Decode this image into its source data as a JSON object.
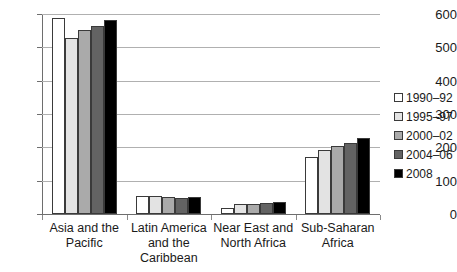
{
  "chart_data": {
    "type": "bar",
    "title": "",
    "subtitle": "",
    "xlabel": "",
    "ylabel": "",
    "ylim": [
      0,
      600
    ],
    "ytick_step": 100,
    "yticks": [
      600,
      500,
      400,
      300,
      200,
      100,
      0
    ],
    "grid": true,
    "legend_position": "right",
    "categories": [
      "Asia and the Pacific",
      "Latin America and the Caribbean",
      "Near East and North Africa",
      "Sub-Saharan Africa"
    ],
    "series": [
      {
        "name": "1990–92",
        "color": "#ffffff",
        "values": [
          587,
          54,
          19,
          170
        ]
      },
      {
        "name": "1995–97",
        "color": "#e3e3e3",
        "values": [
          529,
          53,
          29,
          193
        ]
      },
      {
        "name": "2000–02",
        "color": "#aaaaaa",
        "values": [
          551,
          50,
          31,
          204
        ]
      },
      {
        "name": "2004–06",
        "color": "#636363",
        "values": [
          565,
          47,
          34,
          213
        ]
      },
      {
        "name": "2008",
        "color": "#000000",
        "values": [
          583,
          51,
          37,
          229
        ]
      }
    ]
  },
  "axis": {
    "tick_labels": [
      "600",
      "500",
      "400",
      "300",
      "200",
      "100",
      "0"
    ]
  },
  "legend": {
    "items": [
      {
        "label": "1990–92"
      },
      {
        "label": "1995–97"
      },
      {
        "label": "2000–02"
      },
      {
        "label": "2004–06"
      },
      {
        "label": "2008"
      }
    ]
  },
  "colors": {
    "background": "#ffffff",
    "gridline": "#b0b0b0",
    "axis": "#6e6e6e",
    "bar_border": "#3a3a3a",
    "text": "#1a1a1a"
  }
}
